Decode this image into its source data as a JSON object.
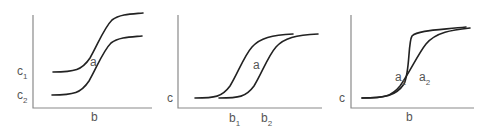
{
  "panels": [
    {
      "id": "panel-1",
      "x_label": "b",
      "y_labels": [
        {
          "text": "c",
          "sub": "1"
        },
        {
          "text": "c",
          "sub": "2"
        }
      ],
      "curve_labels": [
        {
          "text": "a",
          "sub": ""
        }
      ],
      "description": "Two parallel sigmoid curves offset vertically; concentration levels c1 and c2"
    },
    {
      "id": "panel-2",
      "x_label_parts": [
        {
          "text": "b",
          "sub": "1"
        },
        {
          "text": "b",
          "sub": "2"
        }
      ],
      "y_label": "c",
      "curve_labels": [
        {
          "text": "a",
          "sub": ""
        }
      ],
      "description": "Two sigmoid curves offset horizontally; positions b1 and b2"
    },
    {
      "id": "panel-3",
      "x_label": "b",
      "y_label": "c",
      "curve_labels": [
        {
          "text": "a",
          "sub": "1"
        },
        {
          "text": "a",
          "sub": "2"
        }
      ],
      "description": "Two sigmoid curves with different steepness crossing at the midpoint"
    }
  ],
  "colors": {
    "axis": "#8a8a8a",
    "curve": "#222222",
    "label": "#555555"
  }
}
